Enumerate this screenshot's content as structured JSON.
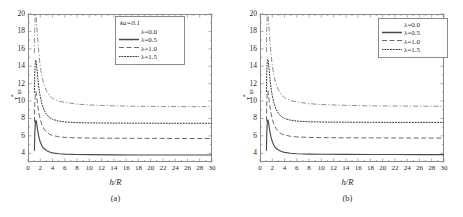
{
  "figure": {
    "panels": [
      {
        "caption": "(a)",
        "legend": {
          "header": "ka=0.1",
          "entries": [
            {
              "label": "λ=0.0",
              "style": "solid"
            },
            {
              "label": "λ=0.5",
              "style": "dashed"
            },
            {
              "label": "λ=1.0",
              "style": "dotted"
            },
            {
              "label": "λ=1.5",
              "style": "dashdot"
            }
          ]
        }
      },
      {
        "caption": "(b)",
        "legend": {
          "header": "",
          "entries": [
            {
              "label": "λ=0.0",
              "style": "solid"
            },
            {
              "label": "λ=0.5",
              "style": "dashed"
            },
            {
              "label": "λ=1.0",
              "style": "dotted"
            },
            {
              "label": "λ=1.5",
              "style": "dashdot"
            }
          ]
        }
      }
    ]
  },
  "chart_data": [
    {
      "type": "line",
      "title": "",
      "panel": "(a)",
      "xlabel": "h/R",
      "ylabel": "τ*ηz",
      "ylabel_parts": {
        "base": "τ",
        "sup": "*",
        "sub": "ηz"
      },
      "xlim": [
        0,
        30
      ],
      "ylim": [
        3,
        20
      ],
      "xticks": [
        0,
        2,
        4,
        6,
        8,
        10,
        12,
        14,
        16,
        18,
        20,
        22,
        24,
        26,
        28,
        30
      ],
      "yticks": [
        4,
        6,
        8,
        10,
        12,
        14,
        16,
        18,
        20
      ],
      "xtick_labels": [
        "0",
        "2",
        "4",
        "6",
        "8",
        "10",
        "12",
        "14",
        "16",
        "18",
        "20",
        "22",
        "24",
        "26",
        "28",
        "30"
      ],
      "ytick_labels": [
        "4",
        "6",
        "8",
        "10",
        "12",
        "14",
        "16",
        "18",
        "20"
      ],
      "minor_ticks": true,
      "grid": false,
      "legend_position": "top-right",
      "annotation": "ka=0.1",
      "series": [
        {
          "name": "λ=0.0",
          "style": "solid",
          "color": "#4a4a4a",
          "asymptote": 3.8,
          "x": [
            1.05,
            1.1,
            1.2,
            1.3,
            1.4,
            1.5,
            1.6,
            1.8,
            2.0,
            2.3,
            2.6,
            3.0,
            3.5,
            4.0,
            5.0,
            6.0,
            8.0,
            10.0,
            14.0,
            18.0,
            22.0,
            26.0,
            30.0
          ],
          "y": [
            4.3,
            6.2,
            7.6,
            7.8,
            7.5,
            7.0,
            6.5,
            5.8,
            5.3,
            4.8,
            4.55,
            4.33,
            4.15,
            4.05,
            3.95,
            3.9,
            3.86,
            3.84,
            3.82,
            3.81,
            3.81,
            3.8,
            3.8
          ]
        },
        {
          "name": "λ=0.5",
          "style": "dashed",
          "color": "#6b6b6b",
          "asymptote": 5.7,
          "x": [
            1.05,
            1.1,
            1.2,
            1.3,
            1.4,
            1.5,
            1.6,
            1.8,
            2.0,
            2.3,
            2.6,
            3.0,
            3.5,
            4.0,
            5.0,
            6.0,
            8.0,
            10.0,
            14.0,
            18.0,
            22.0,
            26.0,
            30.0
          ],
          "y": [
            7.6,
            9.6,
            11.0,
            11.1,
            10.6,
            10.0,
            9.4,
            8.5,
            7.9,
            7.2,
            6.8,
            6.45,
            6.18,
            6.05,
            5.9,
            5.83,
            5.77,
            5.75,
            5.73,
            5.72,
            5.71,
            5.7,
            5.7
          ]
        },
        {
          "name": "λ=1.0",
          "style": "dotted",
          "color": "#3a3a3a",
          "asymptote": 7.45,
          "x": [
            1.05,
            1.1,
            1.2,
            1.3,
            1.4,
            1.5,
            1.6,
            1.8,
            2.0,
            2.3,
            2.6,
            3.0,
            3.5,
            4.0,
            5.0,
            6.0,
            8.0,
            10.0,
            14.0,
            18.0,
            22.0,
            26.0,
            30.0
          ],
          "y": [
            11.0,
            13.2,
            14.6,
            14.7,
            14.1,
            13.4,
            12.6,
            11.4,
            10.5,
            9.6,
            9.0,
            8.5,
            8.1,
            7.9,
            7.7,
            7.6,
            7.52,
            7.49,
            7.47,
            7.46,
            7.45,
            7.45,
            7.45
          ]
        },
        {
          "name": "λ=1.5",
          "style": "dashdot",
          "color": "#8f8f8f",
          "asymptote": 9.35,
          "x": [
            1.05,
            1.1,
            1.2,
            1.3,
            1.4,
            1.5,
            1.6,
            1.8,
            2.0,
            2.3,
            2.6,
            3.0,
            3.5,
            4.0,
            5.0,
            6.0,
            8.0,
            10.0,
            14.0,
            18.0,
            22.0,
            26.0,
            30.0
          ],
          "y": [
            15.5,
            18.2,
            19.9,
            19.8,
            19.0,
            18.0,
            17.0,
            15.3,
            14.0,
            12.7,
            11.9,
            11.2,
            10.6,
            10.3,
            10.0,
            9.85,
            9.65,
            9.55,
            9.45,
            9.4,
            9.38,
            9.36,
            9.35
          ]
        }
      ]
    },
    {
      "type": "line",
      "title": "",
      "panel": "(b)",
      "xlabel": "h/R",
      "ylabel": "τ*ηz",
      "ylabel_parts": {
        "base": "τ",
        "sup": "*",
        "sub": "ηz"
      },
      "xlim": [
        0,
        30
      ],
      "ylim": [
        3,
        20
      ],
      "xticks": [
        0,
        2,
        4,
        6,
        8,
        10,
        12,
        14,
        16,
        18,
        20,
        22,
        24,
        26,
        28,
        30
      ],
      "yticks": [
        4,
        6,
        8,
        10,
        12,
        14,
        16,
        18,
        20
      ],
      "xtick_labels": [
        "0",
        "2",
        "4",
        "6",
        "8",
        "10",
        "12",
        "14",
        "16",
        "18",
        "20",
        "22",
        "24",
        "26",
        "28",
        "30"
      ],
      "ytick_labels": [
        "4",
        "6",
        "8",
        "10",
        "12",
        "14",
        "16",
        "18",
        "20"
      ],
      "minor_ticks": true,
      "grid": false,
      "legend_position": "top-right",
      "annotation": "",
      "series": [
        {
          "name": "λ=0.0",
          "style": "solid",
          "color": "#4a4a4a",
          "asymptote": 3.85,
          "x": [
            1.05,
            1.1,
            1.2,
            1.3,
            1.4,
            1.5,
            1.6,
            1.8,
            2.0,
            2.3,
            2.6,
            3.0,
            3.5,
            4.0,
            5.0,
            6.0,
            8.0,
            10.0,
            14.0,
            18.0,
            22.0,
            26.0,
            30.0
          ],
          "y": [
            4.3,
            6.3,
            7.7,
            7.85,
            7.5,
            7.05,
            6.55,
            5.85,
            5.35,
            4.85,
            4.6,
            4.38,
            4.2,
            4.1,
            4.0,
            3.95,
            3.91,
            3.89,
            3.87,
            3.86,
            3.86,
            3.85,
            3.85
          ]
        },
        {
          "name": "λ=0.5",
          "style": "dashed",
          "color": "#6b6b6b",
          "asymptote": 5.75,
          "x": [
            1.05,
            1.1,
            1.2,
            1.3,
            1.4,
            1.5,
            1.6,
            1.8,
            2.0,
            2.3,
            2.6,
            3.0,
            3.5,
            4.0,
            5.0,
            6.0,
            8.0,
            10.0,
            14.0,
            18.0,
            22.0,
            26.0,
            30.0
          ],
          "y": [
            7.7,
            9.7,
            11.1,
            11.2,
            10.7,
            10.1,
            9.5,
            8.6,
            7.95,
            7.25,
            6.85,
            6.5,
            6.23,
            6.1,
            5.95,
            5.88,
            5.82,
            5.8,
            5.78,
            5.77,
            5.76,
            5.75,
            5.75
          ]
        },
        {
          "name": "λ=1.0",
          "style": "dotted",
          "color": "#3a3a3a",
          "asymptote": 7.55,
          "x": [
            1.05,
            1.1,
            1.2,
            1.3,
            1.4,
            1.5,
            1.6,
            1.8,
            2.0,
            2.3,
            2.6,
            3.0,
            3.5,
            4.0,
            5.0,
            6.0,
            8.0,
            10.0,
            14.0,
            18.0,
            22.0,
            26.0,
            30.0
          ],
          "y": [
            11.1,
            13.3,
            14.7,
            14.8,
            14.2,
            13.5,
            12.7,
            11.5,
            10.6,
            9.7,
            9.1,
            8.6,
            8.2,
            8.0,
            7.8,
            7.7,
            7.62,
            7.59,
            7.57,
            7.56,
            7.55,
            7.55,
            7.55
          ]
        },
        {
          "name": "λ=1.5",
          "style": "dashdot",
          "color": "#8f8f8f",
          "asymptote": 9.4,
          "x": [
            1.05,
            1.1,
            1.2,
            1.3,
            1.4,
            1.5,
            1.6,
            1.8,
            2.0,
            2.3,
            2.6,
            3.0,
            3.5,
            4.0,
            5.0,
            6.0,
            8.0,
            10.0,
            14.0,
            18.0,
            22.0,
            26.0,
            30.0
          ],
          "y": [
            15.6,
            18.3,
            20.0,
            19.9,
            19.1,
            18.1,
            17.1,
            15.4,
            14.1,
            12.8,
            12.0,
            11.3,
            10.7,
            10.4,
            10.05,
            9.9,
            9.7,
            9.6,
            9.5,
            9.45,
            9.43,
            9.41,
            9.4
          ]
        }
      ]
    }
  ]
}
